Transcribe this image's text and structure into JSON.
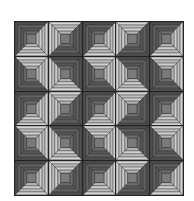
{
  "quilt": {
    "pattern": "log-cabin",
    "rows": 5,
    "cols": 5,
    "colors": {
      "dark": [
        "#4e4e4e",
        "#626262",
        "#575757",
        "#6c6c6c"
      ],
      "light": [
        "#d4d4d4",
        "#bdbdbd",
        "#cfcfcf",
        "#b5b5b5"
      ],
      "center": "#7a7a7a",
      "outline": "#2a2a2a",
      "grid_line": "#222222"
    },
    "dark_corner_grid": [
      [
        "tl",
        "br",
        "tl",
        "br",
        "tl"
      ],
      [
        "bl",
        "tr",
        "bl",
        "tr",
        "bl"
      ],
      [
        "tl",
        "br",
        "tl",
        "br",
        "tl"
      ],
      [
        "bl",
        "tr",
        "bl",
        "tr",
        "bl"
      ],
      [
        "tl",
        "br",
        "tl",
        "br",
        "tl"
      ]
    ]
  }
}
